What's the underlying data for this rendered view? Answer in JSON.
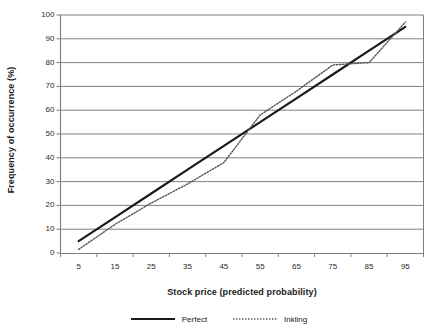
{
  "chart_data": {
    "type": "line",
    "title": "",
    "xlabel": "Stock price (predicted probability)",
    "ylabel": "Frequency of occurrence (%)",
    "categories": [
      "5",
      "15",
      "25",
      "35",
      "45",
      "55",
      "65",
      "75",
      "85",
      "95"
    ],
    "x": [
      5,
      15,
      25,
      35,
      45,
      55,
      65,
      75,
      85,
      95
    ],
    "ylim": [
      0,
      100
    ],
    "ytick_labels": [
      "0",
      "10",
      "20",
      "30",
      "40",
      "50",
      "60",
      "70",
      "80",
      "90",
      "100"
    ],
    "ytick_values": [
      0,
      10,
      20,
      30,
      40,
      50,
      60,
      70,
      80,
      90,
      100
    ],
    "xtick_labels": [
      "5",
      "15",
      "25",
      "35",
      "45",
      "55",
      "65",
      "75",
      "85",
      "95"
    ],
    "grid": "horizontal",
    "legend_position": "bottom",
    "series": [
      {
        "name": "Perfect",
        "style": "solid",
        "color": "#1a1a1a",
        "width": 2.2,
        "values": [
          5,
          15,
          25,
          35,
          45,
          55,
          65,
          75,
          85,
          95
        ]
      },
      {
        "name": "Inkling",
        "style": "dotted",
        "color": "#555555",
        "width": 1.3,
        "values": [
          1.5,
          12,
          21,
          29,
          38,
          58,
          68,
          79,
          80,
          97
        ]
      }
    ]
  },
  "legend": {
    "entries": [
      {
        "label": "Perfect"
      },
      {
        "label": "Inkling"
      }
    ]
  },
  "colors": {
    "grid": "#808080",
    "axis": "#808080",
    "perfect": "#1a1a1a",
    "inkling": "#555555",
    "text": "#1a1a1a"
  }
}
